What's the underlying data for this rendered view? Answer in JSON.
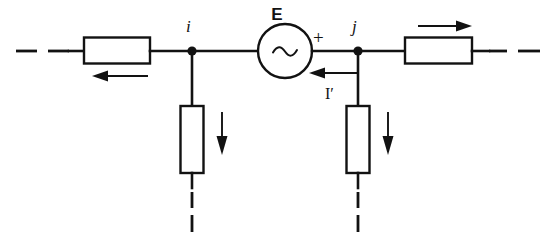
{
  "diagram": {
    "background_color": "#ffffff",
    "line_color": "#121212",
    "labels": {
      "source_label": "E",
      "polarity_plus": "+",
      "current_label": "I′",
      "node_left": "i",
      "node_right": "j"
    },
    "components": [
      {
        "name": "left-series-impedance",
        "type": "rectangle-impedance",
        "orientation": "horizontal"
      },
      {
        "name": "right-series-impedance",
        "type": "rectangle-impedance",
        "orientation": "horizontal"
      },
      {
        "name": "left-shunt-impedance",
        "type": "rectangle-impedance",
        "orientation": "vertical"
      },
      {
        "name": "right-shunt-impedance",
        "type": "rectangle-impedance",
        "orientation": "vertical"
      },
      {
        "name": "ac-voltage-source",
        "type": "circle-with-sine",
        "label": "E"
      }
    ],
    "arrows": [
      {
        "name": "left-branch-current-arrow",
        "direction": "left",
        "label": ""
      },
      {
        "name": "source-current-arrow",
        "direction": "left",
        "label": "I′"
      },
      {
        "name": "right-branch-current-arrow",
        "direction": "right",
        "label": ""
      },
      {
        "name": "left-shunt-current-arrow",
        "direction": "down",
        "label": ""
      },
      {
        "name": "right-shunt-current-arrow",
        "direction": "down",
        "label": ""
      }
    ],
    "nodes": [
      {
        "name": "node-i",
        "label": "i"
      },
      {
        "name": "node-j",
        "label": "j"
      }
    ]
  }
}
